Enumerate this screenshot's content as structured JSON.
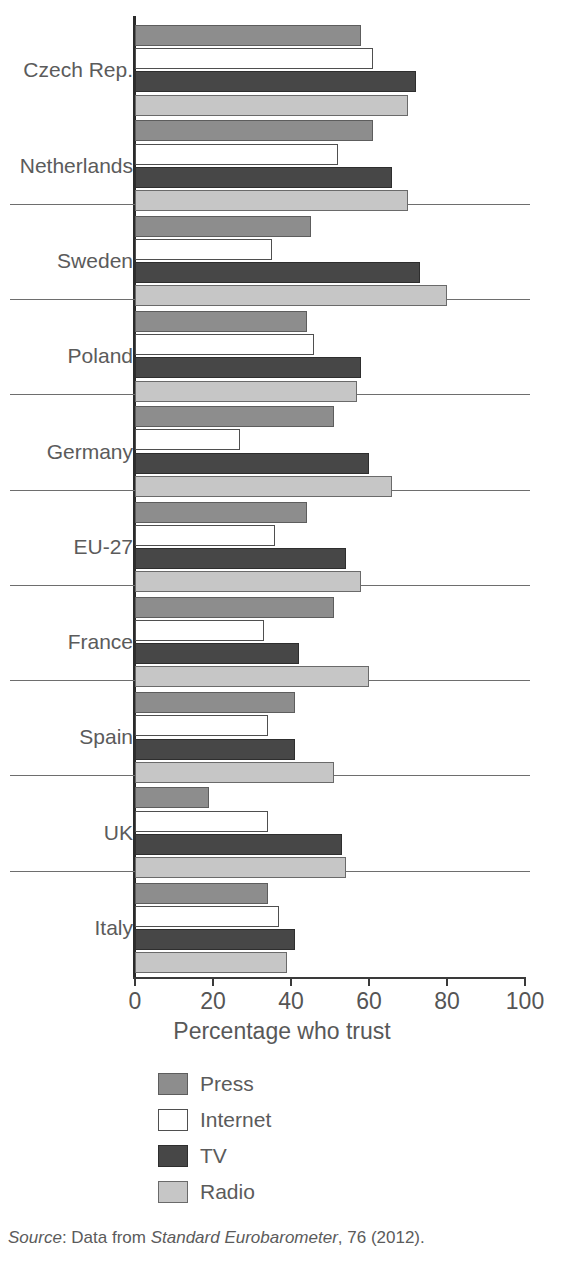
{
  "chart_data": {
    "type": "bar",
    "orientation": "horizontal",
    "title": "",
    "xlabel": "Percentage who trust",
    "ylabel": "",
    "xlim": [
      0,
      100
    ],
    "xticks": [
      0,
      20,
      40,
      60,
      80,
      100
    ],
    "xtick_labels": [
      "0",
      "20",
      "40",
      "60",
      "80",
      "100"
    ],
    "grid": false,
    "legend_position": "below-center",
    "categories": [
      "Czech Rep.",
      "Netherlands",
      "Sweden",
      "Poland",
      "Germany",
      "EU-27",
      "France",
      "Spain",
      "UK",
      "Italy"
    ],
    "series": [
      {
        "name": "Press",
        "color": "#8d8d8d",
        "values": [
          58,
          61,
          45,
          44,
          51,
          44,
          51,
          41,
          19,
          34
        ]
      },
      {
        "name": "Internet",
        "color": "#ffffff",
        "values": [
          61,
          52,
          35,
          46,
          27,
          36,
          33,
          34,
          34,
          37
        ]
      },
      {
        "name": "TV",
        "color": "#474747",
        "values": [
          72,
          66,
          73,
          58,
          60,
          54,
          42,
          41,
          53,
          41
        ]
      },
      {
        "name": "Radio",
        "color": "#c6c6c6",
        "values": [
          70,
          70,
          80,
          57,
          66,
          58,
          60,
          51,
          54,
          39
        ]
      }
    ],
    "source_note": {
      "prefix": "Source",
      "colon": ":  Data from ",
      "publication": "Standard Eurobarometer",
      "suffix": ", 76 (2012)."
    }
  },
  "legend": {
    "items": [
      {
        "label": "Press",
        "swatch": "press-swatch"
      },
      {
        "label": "Internet",
        "swatch": "internet-swatch"
      },
      {
        "label": "TV",
        "swatch": "tv-swatch"
      },
      {
        "label": "Radio",
        "swatch": "radio-swatch"
      }
    ]
  }
}
